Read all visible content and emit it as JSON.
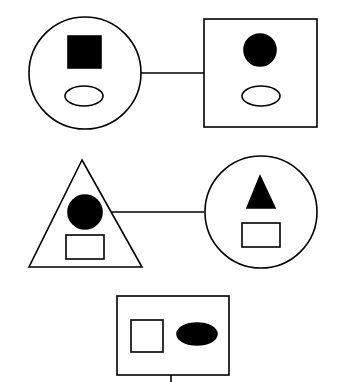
{
  "diagram": {
    "type": "shape-analogy-puzzle",
    "background": "#ffffff",
    "stroke_color": "#000000",
    "fill_color": "#000000",
    "rows": [
      {
        "left": {
          "outer": "circle",
          "inner_top": "filled-square",
          "inner_bottom": "hollow-ellipse"
        },
        "connector": "line",
        "right": {
          "outer": "square",
          "inner_top": "filled-circle",
          "inner_bottom": "hollow-ellipse"
        }
      },
      {
        "left": {
          "outer": "triangle",
          "inner_top": "filled-circle",
          "inner_bottom": "hollow-rectangle"
        },
        "connector": "line",
        "right": {
          "outer": "circle",
          "inner_top": "filled-triangle",
          "inner_bottom": "hollow-rectangle"
        }
      },
      {
        "single": {
          "outer": "rectangle",
          "inner_left": "hollow-square",
          "inner_right": "filled-ellipse"
        },
        "connector": "line-down"
      }
    ]
  }
}
